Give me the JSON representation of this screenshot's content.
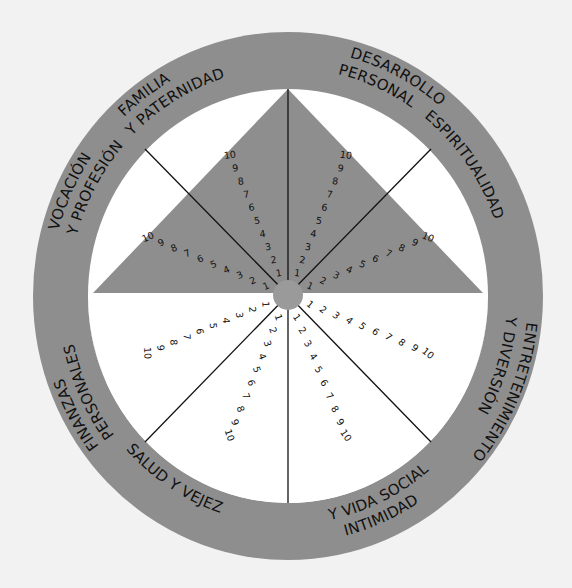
{
  "diagram": {
    "colors": {
      "background": "#f2f2f2",
      "ring": "#8e8e8e",
      "triangle": "#8e8e8e",
      "inner_field": "#ffffff",
      "hub": "#9a9a9a",
      "lines": "#111111",
      "text": "#111111"
    },
    "scale": {
      "min": 1,
      "max": 10,
      "values": [
        "1",
        "2",
        "3",
        "4",
        "5",
        "6",
        "7",
        "8",
        "9",
        "10"
      ]
    },
    "sectors": [
      {
        "id": "familia",
        "label_lines": [
          "FAMILIA",
          "Y PATERNIDAD"
        ]
      },
      {
        "id": "desarrollo",
        "label_lines": [
          "DESARROLLO",
          "PERSONAL"
        ]
      },
      {
        "id": "espiritualidad",
        "label_lines": [
          "ESPIRITUALIDAD"
        ]
      },
      {
        "id": "entretenimiento",
        "label_lines": [
          "ENTRETENIMIENTO",
          "Y DIVERSIÓN"
        ]
      },
      {
        "id": "intimidad",
        "label_lines": [
          "INTIMIDAD",
          "Y VIDA SOCIAL"
        ]
      },
      {
        "id": "salud",
        "label_lines": [
          "SALUD Y VEJEZ"
        ]
      },
      {
        "id": "finanzas",
        "label_lines": [
          "FINANZAS",
          "PERSONALES"
        ]
      },
      {
        "id": "vocacion",
        "label_lines": [
          "VOCACIÓN",
          "Y PROFESIÓN"
        ]
      }
    ]
  }
}
